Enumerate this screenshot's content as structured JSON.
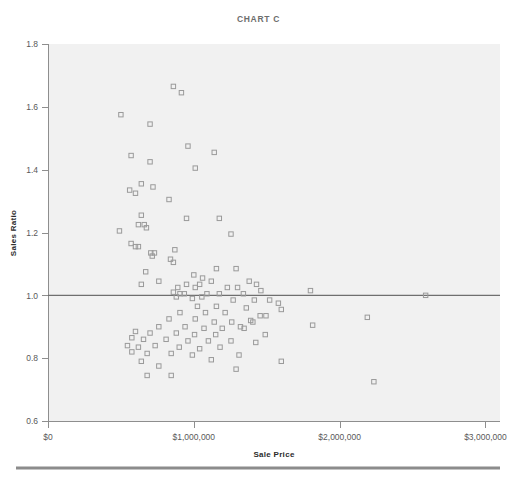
{
  "chart_data": {
    "type": "scatter",
    "title": "CHART C",
    "xlabel": "Sale Price",
    "ylabel": "Sales Ratio",
    "xlim": [
      0,
      3100000
    ],
    "ylim": [
      0.6,
      1.8
    ],
    "xticks": [
      0,
      1000000,
      2000000,
      3000000
    ],
    "xticklabels": [
      "$0",
      "$1,000,000",
      "$2,000,000",
      "$3,000,000"
    ],
    "yticks": [
      0.6,
      0.8,
      1.0,
      1.2,
      1.4,
      1.6,
      1.8
    ],
    "yticklabels": [
      "0.6",
      "0.8",
      "1.0",
      "1.2",
      "1.4",
      "1.6",
      "1.8"
    ],
    "grid": false,
    "legend": null,
    "marker": "open-square",
    "marker_color": "#9a9a9a",
    "reference_line": {
      "axis": "horizontal",
      "value": 1.0,
      "color": "#6f6f6f"
    },
    "point_count": 113,
    "points": [
      [
        860000,
        1.665
      ],
      [
        915000,
        1.645
      ],
      [
        500000,
        1.575
      ],
      [
        700000,
        1.545
      ],
      [
        570000,
        1.445
      ],
      [
        1140000,
        1.455
      ],
      [
        700000,
        1.425
      ],
      [
        960000,
        1.475
      ],
      [
        1010000,
        1.405
      ],
      [
        640000,
        1.355
      ],
      [
        720000,
        1.345
      ],
      [
        560000,
        1.335
      ],
      [
        600000,
        1.325
      ],
      [
        830000,
        1.305
      ],
      [
        640000,
        1.255
      ],
      [
        950000,
        1.245
      ],
      [
        1175000,
        1.245
      ],
      [
        620000,
        1.225
      ],
      [
        660000,
        1.225
      ],
      [
        675000,
        1.215
      ],
      [
        490000,
        1.205
      ],
      [
        1255000,
        1.195
      ],
      [
        570000,
        1.165
      ],
      [
        600000,
        1.155
      ],
      [
        620000,
        1.155
      ],
      [
        705000,
        1.135
      ],
      [
        730000,
        1.135
      ],
      [
        715000,
        1.125
      ],
      [
        870000,
        1.145
      ],
      [
        840000,
        1.115
      ],
      [
        860000,
        1.105
      ],
      [
        1155000,
        1.085
      ],
      [
        1290000,
        1.085
      ],
      [
        670000,
        1.075
      ],
      [
        1000000,
        1.065
      ],
      [
        760000,
        1.045
      ],
      [
        1060000,
        1.055
      ],
      [
        1120000,
        1.045
      ],
      [
        640000,
        1.035
      ],
      [
        950000,
        1.035
      ],
      [
        1040000,
        1.035
      ],
      [
        1380000,
        1.045
      ],
      [
        1430000,
        1.035
      ],
      [
        890000,
        1.025
      ],
      [
        1010000,
        1.025
      ],
      [
        1230000,
        1.025
      ],
      [
        1300000,
        1.025
      ],
      [
        1460000,
        1.015
      ],
      [
        860000,
        1.01
      ],
      [
        905000,
        1.005
      ],
      [
        935000,
        1.005
      ],
      [
        1090000,
        1.005
      ],
      [
        1175000,
        1.005
      ],
      [
        1340000,
        1.005
      ],
      [
        1800000,
        1.015
      ],
      [
        2590000,
        1.0
      ],
      [
        880000,
        0.995
      ],
      [
        990000,
        0.99
      ],
      [
        1055000,
        0.995
      ],
      [
        1270000,
        0.985
      ],
      [
        1415000,
        0.985
      ],
      [
        1520000,
        0.985
      ],
      [
        1580000,
        0.975
      ],
      [
        1025000,
        0.965
      ],
      [
        1155000,
        0.965
      ],
      [
        1360000,
        0.96
      ],
      [
        1600000,
        0.955
      ],
      [
        905000,
        0.945
      ],
      [
        1080000,
        0.945
      ],
      [
        1215000,
        0.945
      ],
      [
        1455000,
        0.935
      ],
      [
        1495000,
        0.935
      ],
      [
        2190000,
        0.93
      ],
      [
        830000,
        0.925
      ],
      [
        1010000,
        0.925
      ],
      [
        1140000,
        0.915
      ],
      [
        1260000,
        0.915
      ],
      [
        1390000,
        0.92
      ],
      [
        1405000,
        0.915
      ],
      [
        1815000,
        0.905
      ],
      [
        760000,
        0.9
      ],
      [
        940000,
        0.9
      ],
      [
        1070000,
        0.895
      ],
      [
        1195000,
        0.895
      ],
      [
        1320000,
        0.9
      ],
      [
        1345000,
        0.895
      ],
      [
        600000,
        0.885
      ],
      [
        700000,
        0.88
      ],
      [
        880000,
        0.88
      ],
      [
        1005000,
        0.875
      ],
      [
        1150000,
        0.875
      ],
      [
        1490000,
        0.875
      ],
      [
        575000,
        0.865
      ],
      [
        655000,
        0.86
      ],
      [
        810000,
        0.86
      ],
      [
        960000,
        0.855
      ],
      [
        1100000,
        0.855
      ],
      [
        1255000,
        0.855
      ],
      [
        1425000,
        0.85
      ],
      [
        545000,
        0.84
      ],
      [
        620000,
        0.835
      ],
      [
        735000,
        0.84
      ],
      [
        900000,
        0.835
      ],
      [
        1040000,
        0.83
      ],
      [
        1180000,
        0.835
      ],
      [
        575000,
        0.82
      ],
      [
        680000,
        0.815
      ],
      [
        845000,
        0.815
      ],
      [
        990000,
        0.81
      ],
      [
        1310000,
        0.81
      ],
      [
        640000,
        0.79
      ],
      [
        1120000,
        0.795
      ],
      [
        1600000,
        0.79
      ],
      [
        760000,
        0.775
      ],
      [
        1290000,
        0.765
      ],
      [
        680000,
        0.745
      ],
      [
        845000,
        0.745
      ],
      [
        2235000,
        0.725
      ]
    ]
  },
  "layout": {
    "plot_left_px": 48,
    "plot_right_px": 500,
    "plot_top_px": 44,
    "plot_bottom_px": 421
  }
}
